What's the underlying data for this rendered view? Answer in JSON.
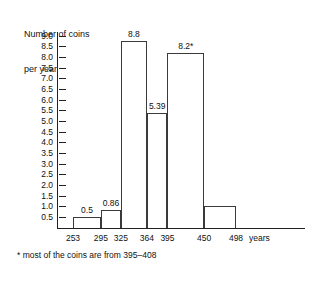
{
  "chart_data": {
    "type": "bar",
    "title": "Number of coins per year",
    "title_lines": [
      "Number of coins",
      "per year"
    ],
    "xlabel": "years",
    "ylabel": "Number of coins per year",
    "ylim": [
      0,
      9.25
    ],
    "grid": false,
    "legend": null,
    "y_ticks": [
      "9.0",
      "8.5",
      "8.0",
      "7.5",
      "7.0",
      "6.5",
      "6.0",
      "5.5",
      "5.0",
      "4.5",
      "4.0",
      "3.5",
      "3.0",
      "2.5",
      "2.0",
      "1.5",
      "1.0",
      "0.5"
    ],
    "y_tick_values": [
      9.0,
      8.5,
      8.0,
      7.5,
      7.0,
      6.5,
      6.0,
      5.5,
      5.0,
      4.5,
      4.0,
      3.5,
      3.0,
      2.5,
      2.0,
      1.5,
      1.0,
      0.5
    ],
    "x_ticks": [
      "253",
      "295",
      "325",
      "364",
      "395",
      "450",
      "498"
    ],
    "x_tick_values": [
      253,
      295,
      325,
      364,
      395,
      450,
      498
    ],
    "x_unit_label": "years",
    "bins": [
      {
        "start": 253,
        "end": 295,
        "value": 0.5,
        "label": "0.5"
      },
      {
        "start": 295,
        "end": 325,
        "value": 0.86,
        "label": "0.86"
      },
      {
        "start": 325,
        "end": 364,
        "value": 8.8,
        "label": "8.8"
      },
      {
        "start": 364,
        "end": 395,
        "value": 5.39,
        "label": "5.39"
      },
      {
        "start": 395,
        "end": 450,
        "value": 8.2,
        "label": "8.2*"
      },
      {
        "start": 450,
        "end": 498,
        "value": 1.03,
        "label": ""
      }
    ],
    "categories": [
      "253-295",
      "295-325",
      "325-364",
      "364-395",
      "395-450",
      "450-498"
    ],
    "values": [
      0.5,
      0.86,
      8.8,
      5.39,
      8.2,
      1.03
    ],
    "annotations": [
      "* most of the coins are from 395-408"
    ],
    "footnote": "* most of the coins are from 395–408",
    "colors": {
      "bar_fill": "#ffffff",
      "bar_stroke": "#3a3a3a",
      "axis": "#222222",
      "text": "#111111",
      "background": "#ffffff"
    }
  }
}
